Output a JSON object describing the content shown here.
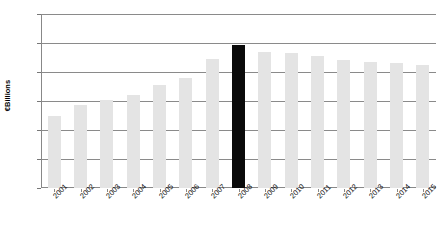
{
  "chart_data": {
    "type": "bar",
    "title": "",
    "xlabel": "",
    "ylabel": "€Billions",
    "ylim": [
      0,
      60
    ],
    "yticks": [
      0,
      10,
      20,
      30,
      40,
      50,
      60
    ],
    "grid": true,
    "legend": false,
    "categories": [
      "2001",
      "2002",
      "2003",
      "2004",
      "2005",
      "2006",
      "2007",
      "2008",
      "2009",
      "2010",
      "2011",
      "2012",
      "2013",
      "2014",
      "2015"
    ],
    "values": [
      25.0,
      28.5,
      30.5,
      32.0,
      35.5,
      38.0,
      44.5,
      49.3,
      47.0,
      46.5,
      45.5,
      44.0,
      43.5,
      43.0,
      42.5
    ],
    "highlight_category": "2008",
    "colors": {
      "bar": "#e4e4e4",
      "highlight_bar": "#0a0a0a",
      "gridline": "#8a8a8a",
      "axis": "#888888",
      "text": "#111111",
      "background": "#ffffff"
    }
  }
}
